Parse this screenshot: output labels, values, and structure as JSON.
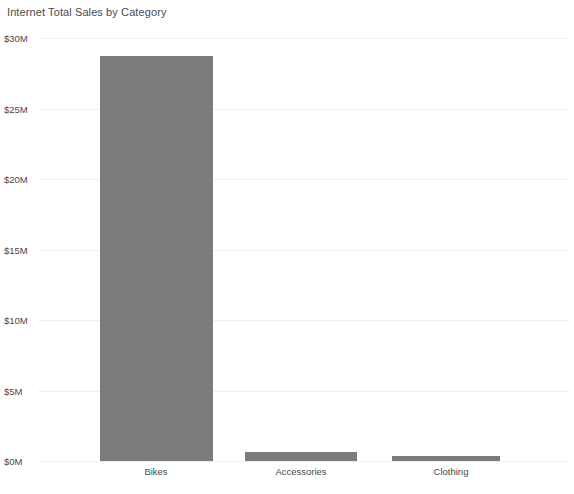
{
  "widget": {
    "title": "Internet Total Sales by Category",
    "background_color": "#ffffff"
  },
  "chart_data": {
    "type": "bar",
    "title": "Internet Total Sales by Category",
    "xlabel": "",
    "ylabel": "",
    "categories": [
      "Bikes",
      "Accessories",
      "Clothing"
    ],
    "values": [
      28.7,
      0.65,
      0.35
    ],
    "value_unit": "millions of dollars",
    "series": [
      {
        "name": "Internet Total Sales",
        "values": [
          28.7,
          0.65,
          0.35
        ],
        "color": "#7b7b7b"
      }
    ],
    "ylim": [
      0,
      30
    ],
    "ytick_values": [
      0,
      5,
      10,
      15,
      20,
      25,
      30
    ],
    "ytick_labels": [
      "$0M",
      "$5M",
      "$10M",
      "$15M",
      "$20M",
      "$25M",
      "$30M"
    ],
    "grid": true,
    "grid_axis": "y",
    "grid_color": "#f0f0f0",
    "legend": false,
    "legend_position": "none",
    "bar_color": "#7b7b7b",
    "annotations": []
  },
  "axis": {
    "y_labels": [
      "$30M",
      "$25M",
      "$20M",
      "$15M",
      "$10M",
      "$5M",
      "$0M"
    ],
    "x_labels": [
      "Bikes",
      "Accessories",
      "Clothing"
    ]
  }
}
